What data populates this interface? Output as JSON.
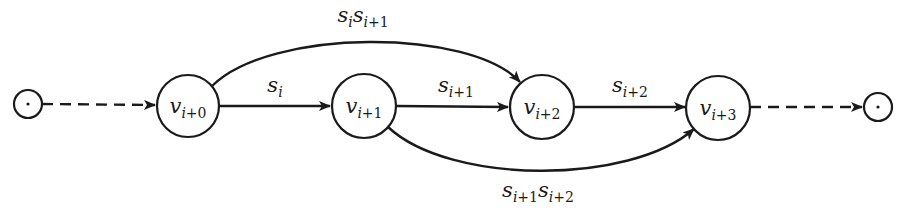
{
  "diagram": {
    "type": "state-transition-graph",
    "terminals": {
      "start": {
        "symbol": "·"
      },
      "end": {
        "symbol": "·"
      }
    },
    "nodes": [
      {
        "id": "v0",
        "base": "v",
        "sub_var": "i",
        "sub_rest": "+0",
        "label": "v_{i+0}"
      },
      {
        "id": "v1",
        "base": "v",
        "sub_var": "i",
        "sub_rest": "+1",
        "label": "v_{i+1}"
      },
      {
        "id": "v2",
        "base": "v",
        "sub_var": "i",
        "sub_rest": "+2",
        "label": "v_{i+2}"
      },
      {
        "id": "v3",
        "base": "v",
        "sub_var": "i",
        "sub_rest": "+3",
        "label": "v_{i+3}"
      }
    ],
    "edges": [
      {
        "from": "start",
        "to": "v0",
        "style": "dashed",
        "label": ""
      },
      {
        "from": "v0",
        "to": "v1",
        "style": "solid",
        "label": "s_i",
        "label_parts": {
          "base": "s",
          "sub_var": "i",
          "sub_rest": ""
        }
      },
      {
        "from": "v1",
        "to": "v2",
        "style": "solid",
        "label": "s_{i+1}",
        "label_parts": {
          "base": "s",
          "sub_var": "i",
          "sub_rest": "+1"
        }
      },
      {
        "from": "v2",
        "to": "v3",
        "style": "solid",
        "label": "s_{i+2}",
        "label_parts": {
          "base": "s",
          "sub_var": "i",
          "sub_rest": "+2"
        }
      },
      {
        "from": "v0",
        "to": "v2",
        "style": "curved-above",
        "label": "s_i s_{i+1}",
        "label_parts": [
          {
            "base": "s",
            "sub_var": "i",
            "sub_rest": ""
          },
          {
            "base": "s",
            "sub_var": "i",
            "sub_rest": "+1"
          }
        ]
      },
      {
        "from": "v1",
        "to": "v3",
        "style": "curved-below",
        "label": "s_{i+1} s_{i+2}",
        "label_parts": [
          {
            "base": "s",
            "sub_var": "i",
            "sub_rest": "+1"
          },
          {
            "base": "s",
            "sub_var": "i",
            "sub_rest": "+2"
          }
        ]
      },
      {
        "from": "v3",
        "to": "end",
        "style": "dashed",
        "label": ""
      }
    ],
    "colors": {
      "stroke": "#1a1a1a",
      "background": "#ffffff"
    }
  }
}
